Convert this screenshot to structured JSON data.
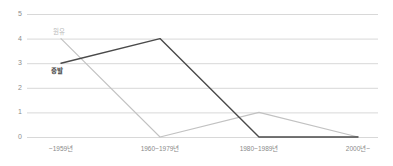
{
  "chart_data": {
    "type": "line",
    "title": "",
    "subtitle": "",
    "xlabel": "",
    "ylabel": "",
    "categories": [
      "~1959년",
      "1960~1979년",
      "1980~1989년",
      "2000년~"
    ],
    "series": [
      {
        "name": "원유",
        "color": "#c2c2c2",
        "values": [
          4,
          0,
          1,
          0
        ]
      },
      {
        "name": "증발",
        "color": "#4a4a4a",
        "values": [
          3,
          4,
          0,
          0
        ]
      }
    ],
    "ylim": [
      0,
      5
    ],
    "yticks": [
      5,
      4,
      3,
      2,
      1,
      0
    ],
    "ytick_labels": [
      "5",
      "4",
      "3",
      "2",
      "1",
      "0"
    ],
    "grid": true,
    "grid_color": "#d8d8d8",
    "legend_position": "inline-labels",
    "background": "#ffffff"
  },
  "axis": {
    "y_tick_labels": [
      "5",
      "4",
      "3",
      "2",
      "1",
      "0"
    ],
    "x_tick_labels": [
      "~1959년",
      "1960~1979년",
      "1980~1989년",
      "2000년~"
    ]
  },
  "labels": {
    "crude": "원유",
    "steam": "증발"
  }
}
